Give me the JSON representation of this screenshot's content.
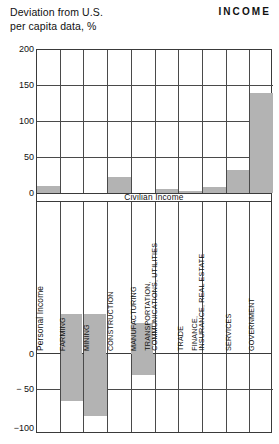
{
  "header": {
    "subtitle_line1": "Deviation from U.S.",
    "subtitle_line2": "per capita data, %",
    "title": "INCOME"
  },
  "band": {
    "label": "Civilian Income"
  },
  "axis": {
    "top_ticks": [
      "200",
      "150",
      "100",
      "50",
      "0"
    ],
    "bottom_ticks": [
      "0",
      "− 50",
      "−100"
    ]
  },
  "colors": {
    "bar": "#b3b3b3",
    "grid": "#4a4a4a",
    "frame": "#3a3a3a",
    "text": "#111111"
  },
  "chart_data": {
    "type": "bar",
    "title": "INCOME",
    "subtitle": "Deviation from U.S. per capita data, %",
    "ylabel": "Deviation from U.S. per capita data, %",
    "xlabel": "",
    "grid": true,
    "legend": null,
    "note": "Civilian Income",
    "ylim": [
      -100,
      200
    ],
    "top_panel_range": [
      0,
      200
    ],
    "bottom_panel_range": [
      -100,
      0
    ],
    "categories": [
      "Personal Income",
      "FARMING",
      "MINING",
      "CONSTRUCTION",
      "MANUFACTURING",
      "TRANSPORTATION, COMMUNICATIONS, UTILITIES",
      "TRADE",
      "FINANCE, INSURANCE, REAL ESTATE",
      "SERVICES",
      "GOVERNMENT"
    ],
    "category_labels": [
      {
        "lines": [
          "Personal Income"
        ],
        "style": "big"
      },
      {
        "lines": [
          "FARMING"
        ],
        "style": "normal"
      },
      {
        "lines": [
          "MINING"
        ],
        "style": "normal"
      },
      {
        "lines": [
          "CONSTRUCTION"
        ],
        "style": "normal"
      },
      {
        "lines": [
          "MANUFACTURING"
        ],
        "style": "normal"
      },
      {
        "lines": [
          "TRANSPORTATION,",
          "COMMUNICATIONS, UTILITIES"
        ],
        "style": "two"
      },
      {
        "lines": [
          "TRADE"
        ],
        "style": "normal"
      },
      {
        "lines": [
          "FINANCE,",
          "INSURANCE, REAL ESTATE"
        ],
        "style": "two"
      },
      {
        "lines": [
          "SERVICES"
        ],
        "style": "normal"
      },
      {
        "lines": [
          "GOVERNMENT"
        ],
        "style": "normal"
      }
    ],
    "values": [
      10,
      -62,
      -82,
      23,
      -28,
      6,
      3,
      9,
      32,
      140
    ]
  }
}
